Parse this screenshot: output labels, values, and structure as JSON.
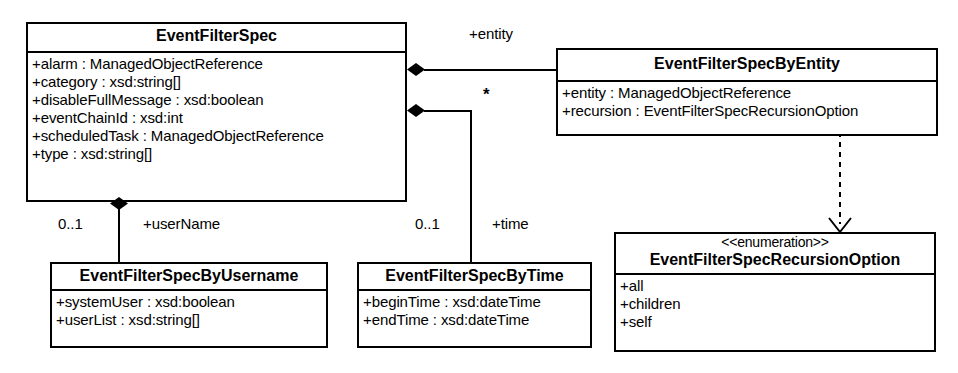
{
  "diagram": {
    "type": "uml-class-diagram"
  },
  "classes": {
    "event_filter_spec": {
      "name": "EventFilterSpec",
      "attributes": [
        "+alarm : ManagedObjectReference",
        "+category : xsd:string[]",
        "+disableFullMessage : xsd:boolean",
        "+eventChainId : xsd:int",
        "+scheduledTask : ManagedObjectReference",
        "+type : xsd:string[]"
      ]
    },
    "event_filter_spec_by_entity": {
      "name": "EventFilterSpecByEntity",
      "attributes": [
        "+entity : ManagedObjectReference",
        "+recursion : EventFilterSpecRecursionOption"
      ]
    },
    "event_filter_spec_by_username": {
      "name": "EventFilterSpecByUsername",
      "attributes": [
        "+systemUser : xsd:boolean",
        "+userList : xsd:string[]"
      ]
    },
    "event_filter_spec_by_time": {
      "name": "EventFilterSpecByTime",
      "attributes": [
        "+beginTime : xsd:dateTime",
        "+endTime : xsd:dateTime"
      ]
    },
    "event_filter_spec_recursion_option": {
      "stereotype": "<<enumeration>>",
      "name": "EventFilterSpecRecursionOption",
      "attributes": [
        "+all",
        "+children",
        "+self"
      ]
    }
  },
  "associations": {
    "entity": {
      "role_label": "+entity",
      "multiplicity": "*"
    },
    "username": {
      "role_label": "+userName",
      "multiplicity": "0..1"
    },
    "time": {
      "role_label": "+time",
      "multiplicity": "0..1"
    }
  },
  "colors": {
    "line": "#000000",
    "fill": "#ffffff",
    "text": "#000000"
  }
}
